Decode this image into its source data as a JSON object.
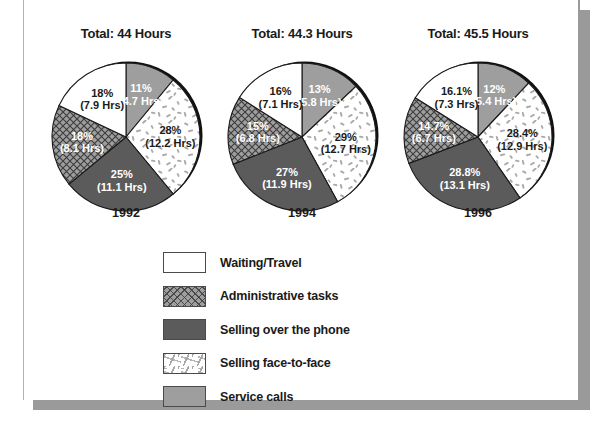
{
  "chart_data": {
    "type": "pie",
    "title": "",
    "legend_position": "bottom-left",
    "categories": [
      "Waiting/Travel",
      "Administrative tasks",
      "Selling over the phone",
      "Selling face-to-face",
      "Service calls"
    ],
    "category_patterns": [
      "white",
      "cross-hatch",
      "solid-dark-gray",
      "speckled",
      "medium-gray"
    ],
    "charts": [
      {
        "year": "1992",
        "total_label": "Total: 44 Hours",
        "total_hours": 44,
        "slices": [
          {
            "category": "Service calls",
            "percent": 11,
            "hours": 4.7,
            "percent_label": "11%",
            "hours_label": "(4.7 Hrs)"
          },
          {
            "category": "Selling face-to-face",
            "percent": 28,
            "hours": 12.2,
            "percent_label": "28%",
            "hours_label": "(12.2 Hrs)"
          },
          {
            "category": "Selling over the phone",
            "percent": 25,
            "hours": 11.1,
            "percent_label": "25%",
            "hours_label": "(11.1 Hrs)"
          },
          {
            "category": "Administrative tasks",
            "percent": 18,
            "hours": 8.1,
            "percent_label": "18%",
            "hours_label": "(8.1 Hrs)"
          },
          {
            "category": "Waiting/Travel",
            "percent": 18,
            "hours": 7.9,
            "percent_label": "18%",
            "hours_label": "(7.9 Hrs)"
          }
        ]
      },
      {
        "year": "1994",
        "total_label": "Total: 44.3 Hours",
        "total_hours": 44.3,
        "slices": [
          {
            "category": "Service calls",
            "percent": 13,
            "hours": 5.8,
            "percent_label": "13%",
            "hours_label": "(5.8 Hrs)"
          },
          {
            "category": "Selling face-to-face",
            "percent": 29,
            "hours": 12.7,
            "percent_label": "29%",
            "hours_label": "(12.7 Hrs)"
          },
          {
            "category": "Selling over the phone",
            "percent": 27,
            "hours": 11.9,
            "percent_label": "27%",
            "hours_label": "(11.9 Hrs)"
          },
          {
            "category": "Administrative tasks",
            "percent": 15,
            "hours": 6.8,
            "percent_label": "15%",
            "hours_label": "(6.8 Hrs)"
          },
          {
            "category": "Waiting/Travel",
            "percent": 16,
            "hours": 7.1,
            "percent_label": "16%",
            "hours_label": "(7.1 Hrs)"
          }
        ]
      },
      {
        "year": "1996",
        "total_label": "Total: 45.5 Hours",
        "total_hours": 45.5,
        "slices": [
          {
            "category": "Service calls",
            "percent": 12,
            "hours": 5.4,
            "percent_label": "12%",
            "hours_label": "(5.4 Hrs)"
          },
          {
            "category": "Selling face-to-face",
            "percent": 28.4,
            "hours": 12.9,
            "percent_label": "28.4%",
            "hours_label": "(12.9 Hrs)"
          },
          {
            "category": "Selling over the phone",
            "percent": 28.8,
            "hours": 13.1,
            "percent_label": "28.8%",
            "hours_label": "(13.1 Hrs)"
          },
          {
            "category": "Administrative tasks",
            "percent": 14.7,
            "hours": 6.7,
            "percent_label": "14.7%",
            "hours_label": "(6.7 Hrs)"
          },
          {
            "category": "Waiting/Travel",
            "percent": 16.1,
            "hours": 7.3,
            "percent_label": "16.1%",
            "hours_label": "(7.3 Hrs)"
          }
        ]
      }
    ]
  },
  "colors": {
    "white": "#ffffff",
    "medium_gray": "#9e9e9e",
    "dark_gray": "#5b5b5b",
    "outline": "#1a1a1a",
    "frame": "#9a9a9a",
    "text": "#1a1a1a"
  }
}
